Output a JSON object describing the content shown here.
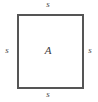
{
  "figure": {
    "name": "square-with-side-and-area-labels",
    "shape": "square",
    "background_color": "#ffffff",
    "stroke_color": "#555555",
    "stroke_width_px": 1.6,
    "text_color": "#4a4a4a",
    "square": {
      "x": 17,
      "y": 14,
      "width": 66,
      "height": 74
    },
    "labels": {
      "top_side": "s",
      "left_side": "s",
      "right_side": "s",
      "bottom_side": "s",
      "area": "A"
    }
  }
}
